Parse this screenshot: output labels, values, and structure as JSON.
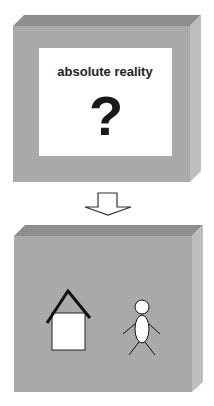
{
  "top_box": {
    "label": "absolute reality",
    "symbol": "?",
    "face_color": "#a9a9a9",
    "top_color": "#8e8e8e",
    "side_color": "#bdbdbd",
    "panel_color": "#ffffff"
  },
  "arrow": {
    "icon": "down-arrow-icon",
    "fill": "#ffffff",
    "stroke": "#333333"
  },
  "bottom_box": {
    "face_color": "#a9a9a9",
    "top_color": "#8e8e8e",
    "side_color": "#bdbdbd",
    "icons": [
      "house-icon",
      "stick-figure-icon"
    ]
  }
}
